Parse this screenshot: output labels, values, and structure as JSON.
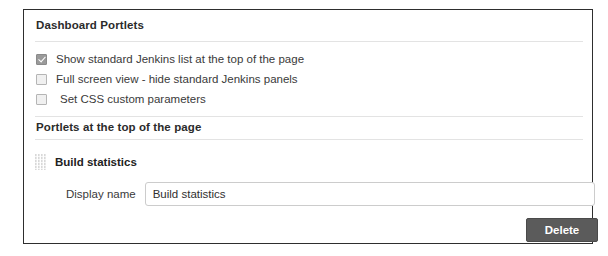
{
  "panel": {
    "heading": "Dashboard Portlets",
    "options": [
      {
        "label": "Show standard Jenkins list at the top of the page",
        "checked": true
      },
      {
        "label": "Full screen view - hide standard Jenkins panels",
        "checked": false
      },
      {
        "label": "Set CSS custom parameters",
        "checked": false
      }
    ],
    "subheading": "Portlets at the top of the page",
    "portlet": {
      "drag_handle_icon": "drag-grip-icon",
      "title": "Build statistics",
      "display_name_label": "Display name",
      "display_name_value": "Build statistics",
      "display_name_placeholder": "",
      "delete_label": "Delete"
    }
  },
  "colors": {
    "panel_border": "#2e2e2e",
    "rule": "#e3e3e3",
    "checkbox_checked_fill": "#9a9a9a",
    "checkbox_unchecked_fill": "#f0f0f0",
    "delete_button_bg": "#5b5b5b",
    "delete_button_text": "#ffffff",
    "text": "#3a3a3a"
  }
}
